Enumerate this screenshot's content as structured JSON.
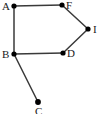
{
  "figure": {
    "name": "undirected-graph-diagram",
    "background_color": "#ffffff",
    "edge_color": "#3a3a3a",
    "node_color": "#000000",
    "label_color": "#1a1a1a",
    "width": 99,
    "height": 114
  },
  "graph": {
    "nodes": [
      {
        "id": "A",
        "label": "A",
        "x": 14,
        "y": 6,
        "r": 2.6,
        "label_x": 2,
        "label_y": 1,
        "label_anchor": "left"
      },
      {
        "id": "F",
        "label": "F",
        "x": 62,
        "y": 5,
        "r": 2.6,
        "label_x": 66,
        "label_y": 0,
        "label_anchor": "right"
      },
      {
        "id": "I",
        "label": "I",
        "x": 88,
        "y": 29,
        "r": 2.6,
        "label_x": 93,
        "label_y": 24,
        "label_anchor": "right"
      },
      {
        "id": "D",
        "label": "D",
        "x": 63,
        "y": 53,
        "r": 2.6,
        "label_x": 67,
        "label_y": 48,
        "label_anchor": "right"
      },
      {
        "id": "B",
        "label": "B",
        "x": 14,
        "y": 54,
        "r": 2.6,
        "label_x": 2,
        "label_y": 49,
        "label_anchor": "left"
      },
      {
        "id": "C",
        "label": "C",
        "x": 38,
        "y": 102,
        "r": 2.9,
        "label_x": 35,
        "label_y": 106,
        "label_anchor": "below"
      }
    ],
    "edges": [
      {
        "from": "A",
        "to": "F"
      },
      {
        "from": "A",
        "to": "B"
      },
      {
        "from": "F",
        "to": "I"
      },
      {
        "from": "I",
        "to": "D"
      },
      {
        "from": "B",
        "to": "D"
      },
      {
        "from": "B",
        "to": "C"
      }
    ]
  }
}
